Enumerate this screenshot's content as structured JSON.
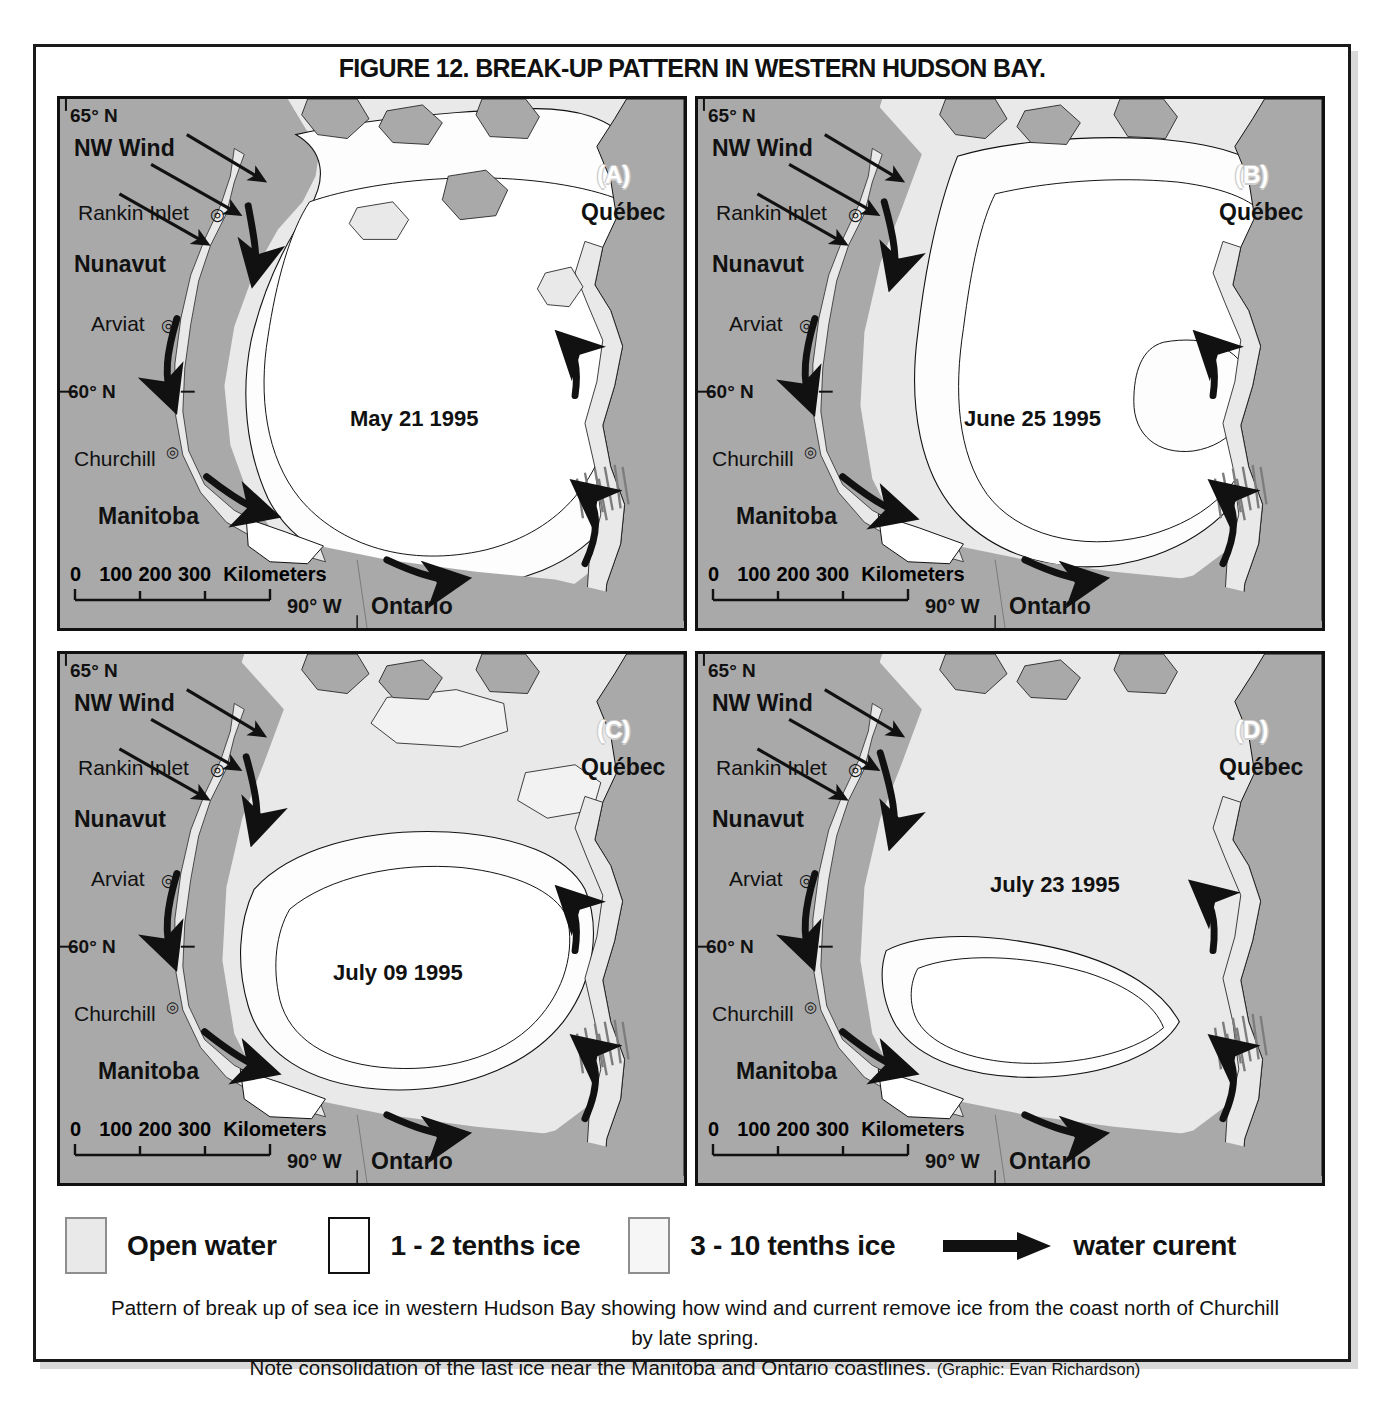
{
  "figure": {
    "title": "FIGURE 12. BREAK-UP PATTERN IN WESTERN HUDSON BAY.",
    "caption_line1": "Pattern of break up of sea ice in western Hudson Bay showing how wind and current remove ice from the coast north of Churchill by late spring.",
    "caption_line2": "Note consolidation of the last ice near the Manitoba and Ontario coastlines.",
    "caption_credit": "(Graphic: Evan Richardson)"
  },
  "colors": {
    "land": "#a9a9a9",
    "open_water": "#e9e9e9",
    "ice_1_2": "#ffffff",
    "ice_3_10": "#f6f6f6",
    "outline": "#111111",
    "page_background": "#ffffff"
  },
  "common_labels": {
    "lat_north": "65° N",
    "lat_sixty": "60° N",
    "lon_west": "90° W",
    "wind": "NW Wind",
    "rankin": "Rankin Inlet",
    "nunavut": "Nunavut",
    "arviat": "Arviat",
    "churchill": "Churchill",
    "manitoba": "Manitoba",
    "ontario": "Ontario",
    "quebec": "Québec",
    "scale_0": "0",
    "scale_100": "100",
    "scale_200": "200",
    "scale_300": "300",
    "scale_units": "Kilometers"
  },
  "panels": [
    {
      "id": "(A)",
      "date": "May 21 1995",
      "key": "a"
    },
    {
      "id": "(B)",
      "date": "June 25 1995",
      "key": "b"
    },
    {
      "id": "(C)",
      "date": "July 09 1995",
      "key": "c"
    },
    {
      "id": "(D)",
      "date": "July 23 1995",
      "key": "d"
    }
  ],
  "legend": {
    "items": [
      {
        "label": "Open water",
        "swatch": "light-gray-box"
      },
      {
        "label": "1 - 2 tenths ice",
        "swatch": "white-box"
      },
      {
        "label": "3 - 10 tenths ice",
        "swatch": "off-white-box"
      },
      {
        "label": "water curent",
        "swatch": "black-arrow"
      }
    ]
  }
}
